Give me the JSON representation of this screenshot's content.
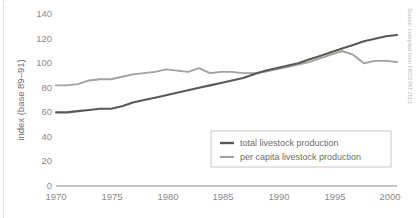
{
  "chart_data": {
    "type": "line",
    "title": "",
    "xlabel": "",
    "ylabel": "index (base 89–91)",
    "xlim": [
      1970,
      2001
    ],
    "ylim": [
      0,
      145
    ],
    "yticks": [
      0,
      20,
      40,
      60,
      80,
      100,
      120,
      140
    ],
    "xticks": [
      1970,
      1975,
      1980,
      1985,
      1990,
      1995,
      2000
    ],
    "grid": false,
    "legend_position": "inside-bottom-right",
    "x": [
      1970,
      1971,
      1972,
      1973,
      1974,
      1975,
      1976,
      1977,
      1978,
      1979,
      1980,
      1981,
      1982,
      1983,
      1984,
      1985,
      1986,
      1987,
      1988,
      1989,
      1990,
      1991,
      1992,
      1993,
      1994,
      1995,
      1996,
      1997,
      1998,
      1999,
      2000,
      2001
    ],
    "series": [
      {
        "name": "total livestock production",
        "color": "#5b5956",
        "values": [
          60,
          60,
          61,
          62,
          63,
          63,
          65,
          68,
          70,
          72,
          74,
          76,
          78,
          80,
          82,
          84,
          86,
          88,
          91,
          94,
          96,
          98,
          100,
          103,
          106,
          109,
          112,
          115,
          118,
          120,
          122,
          123
        ]
      },
      {
        "name": "per capita livestock production",
        "color": "#a3a09d",
        "values": [
          82,
          82,
          83,
          86,
          87,
          87,
          89,
          91,
          92,
          93,
          95,
          94,
          93,
          96,
          92,
          93,
          93,
          92,
          92,
          93,
          95,
          97,
          99,
          101,
          104,
          107,
          110,
          107,
          100,
          102,
          102,
          101
        ]
      }
    ],
    "annotations": [
      {
        "name": "source-note",
        "text": "Source: compiled from FAOSTAT 2001"
      }
    ]
  },
  "axes": {
    "y_title": "index (base 89–91)",
    "y_ticks": [
      "140",
      "120",
      "100",
      "80",
      "60",
      "40",
      "20",
      "0"
    ],
    "x_ticks": [
      "1970",
      "1975",
      "1980",
      "1985",
      "1990",
      "1995",
      "2000"
    ]
  },
  "legend": {
    "entries": [
      {
        "label": "total livestock production",
        "color": "#5b5956"
      },
      {
        "label": "per capita livestock production",
        "color": "#a3a09d"
      }
    ]
  },
  "source": {
    "text": "Source: compiled from FAOSTAT 2001"
  }
}
